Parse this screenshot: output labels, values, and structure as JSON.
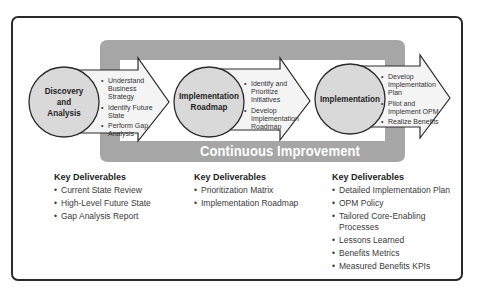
{
  "cycle": {
    "label": "Continuous Improvement",
    "color": "#a6a6a6"
  },
  "phases": [
    {
      "title_lines": [
        "Discovery",
        "and",
        "Analysis"
      ],
      "activities": [
        "Understand Business Strategy",
        "Identify Future State",
        "Perform Gap Analysis"
      ],
      "deliverables_heading": "Key Deliverables",
      "deliverables": [
        "Current State Review",
        "High-Level Future State",
        "Gap Analysis Report"
      ]
    },
    {
      "title_lines": [
        "Implementation",
        "Roadmap"
      ],
      "activities": [
        "Identify and Prioritize Initiatives",
        "Develop Implementation Roadmap"
      ],
      "deliverables_heading": "Key Deliverables",
      "deliverables": [
        "Prioritization Matrix",
        "Implementation Roadmap"
      ]
    },
    {
      "title_lines": [
        "Implementation"
      ],
      "activities": [
        "Develop Implementation Plan",
        "Pilot and Implement OPM",
        "Realize Benefits"
      ],
      "deliverables_heading": "Key Deliverables",
      "deliverables": [
        "Detailed Implementation Plan",
        "OPM Policy",
        "Tailored Core-Enabling Processes",
        "Lessons Learned",
        "Benefits Metrics",
        "Measured Benefits KPIs"
      ]
    }
  ],
  "colors": {
    "circle_fill": "#d9d9d9",
    "arrow_fill": "#f4f4f4",
    "outline": "#2b2b2b"
  }
}
